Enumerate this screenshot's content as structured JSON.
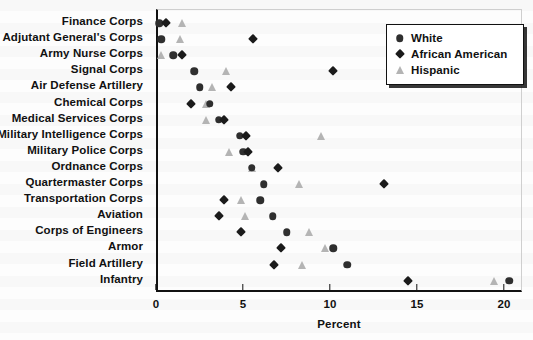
{
  "chart_data": {
    "type": "scatter",
    "title": "",
    "xlabel": "Percent",
    "ylabel": "",
    "xlim": [
      0,
      21
    ],
    "xticks": [
      0,
      5,
      10,
      15,
      20
    ],
    "xtick_labels": [
      "0",
      "5",
      "10",
      "15",
      "20"
    ],
    "grid": false,
    "legend_position": "top-right",
    "orientation": "horizontal-dot-plot",
    "categories": [
      "Finance Corps",
      "Adjutant General's Corps",
      "Army Nurse Corps",
      "Signal Corps",
      "Air Defense Artillery",
      "Chemical Corps",
      "Medical Services Corps",
      "Military Intelligence Corps",
      "Military Police Corps",
      "Ordnance Corps",
      "Quartermaster Corps",
      "Transportation Corps",
      "Aviation",
      "Corps of Engineers",
      "Armor",
      "Field Artillery",
      "Infantry"
    ],
    "series": [
      {
        "name": "White",
        "marker": "circle",
        "color": "#2f2f2f",
        "values": [
          0.2,
          0.3,
          1.0,
          2.2,
          2.5,
          3.1,
          3.6,
          4.8,
          5.0,
          5.5,
          6.2,
          6.0,
          6.7,
          7.5,
          10.2,
          11.0,
          20.3
        ]
      },
      {
        "name": "African American",
        "marker": "diamond",
        "color": "#1b1b1b",
        "values": [
          0.6,
          5.6,
          1.5,
          10.2,
          4.3,
          2.0,
          3.9,
          5.2,
          5.3,
          7.0,
          13.1,
          3.9,
          3.6,
          4.9,
          7.2,
          6.8,
          14.5
        ]
      },
      {
        "name": "Hispanic",
        "marker": "triangle",
        "color": "#b4b4b4",
        "values": [
          1.5,
          1.4,
          0.3,
          4.0,
          3.2,
          2.9,
          2.9,
          9.5,
          4.2,
          5.5,
          8.2,
          4.9,
          5.1,
          8.8,
          9.7,
          8.4,
          19.4
        ]
      }
    ]
  },
  "legend": {
    "items": [
      {
        "label": "White",
        "marker": "circle"
      },
      {
        "label": "African American",
        "marker": "diamond"
      },
      {
        "label": "Hispanic",
        "marker": "triangle"
      }
    ]
  }
}
